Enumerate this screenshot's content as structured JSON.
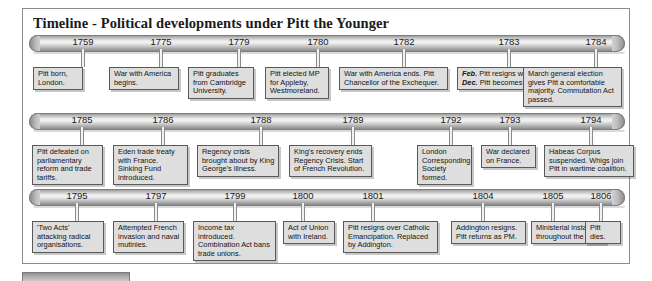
{
  "page": {
    "title": "Timeline - Political developments under Pitt the Younger"
  },
  "chart_data": {
    "type": "table",
    "title": "Timeline - Political developments under Pitt the Younger",
    "rows": [
      {
        "row_index": 1,
        "events": [
          {
            "year": "1759",
            "text": "Pitt born, London."
          },
          {
            "year": "1775",
            "text": "War with America begins."
          },
          {
            "year": "1779",
            "text": "Pitt graduates from Cambridge University."
          },
          {
            "year": "1780",
            "text": "Pitt elected MP for Appleby, Westmoreland."
          },
          {
            "year": "1782",
            "text": "War with America ends. Pitt Chancellor of the Exchequer."
          },
          {
            "year": "1783",
            "text_parts": [
              {
                "emphasis": "Feb.",
                "text": " Pitt resigns with Shelburne."
              },
              {
                "emphasis": "Dec.",
                "text": " Pitt becomes Prime Minister."
              }
            ]
          },
          {
            "year": "1784",
            "text": "March general election gives Pitt a comfortable majority. Commutation Act passed."
          }
        ]
      },
      {
        "row_index": 2,
        "events": [
          {
            "year": "1785",
            "text": "Pitt defeated on parliamentary reform and trade tariffs."
          },
          {
            "year": "1786",
            "text": "Eden trade treaty with France. Sinking Fund introduced."
          },
          {
            "year": "1788",
            "text": "Regency crisis brought about by King George's illness."
          },
          {
            "year": "1789",
            "text": "King's recovery ends Regency Crisis. Start of French Revolution."
          },
          {
            "year": "1792",
            "text": "London Corresponding Society formed."
          },
          {
            "year": "1793",
            "text": "War declared on France."
          },
          {
            "year": "1794",
            "text": "Habeas Corpus suspended. Whigs join Pitt in wartime coalition."
          }
        ]
      },
      {
        "row_index": 3,
        "events": [
          {
            "year": "1795",
            "text": "'Two Acts' attacking radical organisations."
          },
          {
            "year": "1797",
            "text": "Attempted French invasion and naval mutinies."
          },
          {
            "year": "1799",
            "text": "Income tax introduced. Combination Act bans trade unions."
          },
          {
            "year": "1800",
            "text": "Act of Union with Ireland."
          },
          {
            "year": "1801",
            "text": "Pitt resigns over Catholic Emancipation. Replaced by Addington."
          },
          {
            "year": "1804",
            "text": "Addington resigns. Pitt returns as PM."
          },
          {
            "year": "1805",
            "text": "Ministerial instability throughout the year."
          },
          {
            "year": "1806",
            "text": "Pitt dies."
          }
        ]
      }
    ]
  },
  "rows": [
    {
      "events": [
        {
          "year": "1759",
          "text": "Pitt born, London.",
          "year_x": 60,
          "stem_x": 60,
          "stem_h": 18,
          "box_x": 10,
          "box_y": 32,
          "box_w": 50,
          "box_h": 22
        },
        {
          "year": "1775",
          "text": "War with America begins.",
          "year_x": 138,
          "stem_x": 138,
          "stem_h": 18,
          "box_x": 86,
          "box_y": 32,
          "box_w": 70,
          "box_h": 22
        },
        {
          "year": "1779",
          "text": "Pitt graduates from Cambridge University.",
          "year_x": 216,
          "stem_x": 216,
          "stem_h": 18,
          "box_x": 165,
          "box_y": 32,
          "box_w": 66,
          "box_h": 31
        },
        {
          "year": "1780",
          "text": "Pitt elected MP for Appleby, Westmoreland.",
          "year_x": 295,
          "stem_x": 295,
          "stem_h": 18,
          "box_x": 242,
          "box_y": 32,
          "box_w": 64,
          "box_h": 31
        },
        {
          "year": "1782",
          "text": "War with America ends. Pitt Chancellor of the Exchequer.",
          "year_x": 381,
          "stem_x": 381,
          "stem_h": 18,
          "box_x": 316,
          "box_y": 32,
          "box_w": 109,
          "box_h": 22
        },
        {
          "year": "1783",
          "text": "",
          "year_x": 486,
          "stem_x": 486,
          "stem_h": 18,
          "box_x": 434,
          "box_y": 32,
          "box_w": 128,
          "box_h": 22,
          "rich": true
        },
        {
          "year": "1784",
          "text": "March general election gives Pitt a comfortable majority. Commutation Act passed.",
          "year_x": 573,
          "stem_x": 573,
          "stem_h": 18,
          "box_x": 500,
          "box_y": 32,
          "box_w": 99,
          "box_h": 31
        }
      ]
    },
    {
      "events": [
        {
          "year": "1785",
          "text": "Pitt defeated on parliamentary reform and trade tariffs.",
          "year_x": 59,
          "stem_x": 59,
          "stem_h": 18,
          "box_x": 9,
          "box_y": 32,
          "box_w": 71,
          "box_h": 31
        },
        {
          "year": "1786",
          "text": "Eden trade treaty with France. Sinking Fund introduced.",
          "year_x": 140,
          "stem_x": 140,
          "stem_h": 18,
          "box_x": 90,
          "box_y": 32,
          "box_w": 75,
          "box_h": 31
        },
        {
          "year": "1788",
          "text": "Regency crisis brought about by King George's illness.",
          "year_x": 238,
          "stem_x": 238,
          "stem_h": 18,
          "box_x": 174,
          "box_y": 32,
          "box_w": 82,
          "box_h": 31
        },
        {
          "year": "1789",
          "text": "King's recovery ends Regency Crisis. Start of French Revolution.",
          "year_x": 330,
          "stem_x": 330,
          "stem_h": 18,
          "box_x": 266,
          "box_y": 32,
          "box_w": 83,
          "box_h": 31
        },
        {
          "year": "1792",
          "text": "London Corresponding Society formed.",
          "year_x": 428,
          "stem_x": 428,
          "stem_h": 18,
          "box_x": 394,
          "box_y": 32,
          "box_w": 55,
          "box_h": 31
        },
        {
          "year": "1793",
          "text": "War declared on France.",
          "year_x": 487,
          "stem_x": 487,
          "stem_h": 18,
          "box_x": 458,
          "box_y": 32,
          "box_w": 55,
          "box_h": 22
        },
        {
          "year": "1794",
          "text": "Habeas Corpus suspended. Whigs join Pitt in wartime coalition.",
          "year_x": 568,
          "stem_x": 568,
          "stem_h": 18,
          "box_x": 521,
          "box_y": 32,
          "box_w": 90,
          "box_h": 31
        }
      ]
    },
    {
      "events": [
        {
          "year": "1795",
          "text": "'Two Acts' attacking radical organisations.",
          "year_x": 54,
          "stem_x": 54,
          "stem_h": 18,
          "box_x": 9,
          "box_y": 32,
          "box_w": 72,
          "box_h": 22
        },
        {
          "year": "1797",
          "text": "Attempted French invasion and naval mutinies.",
          "year_x": 133,
          "stem_x": 133,
          "stem_h": 18,
          "box_x": 90,
          "box_y": 32,
          "box_w": 71,
          "box_h": 31
        },
        {
          "year": "1799",
          "text": "Income tax introduced. Combination Act bans trade unions.",
          "year_x": 212,
          "stem_x": 212,
          "stem_h": 18,
          "box_x": 170,
          "box_y": 32,
          "box_w": 83,
          "box_h": 31
        },
        {
          "year": "1800",
          "text": "Act of Union with Ireland.",
          "year_x": 280,
          "stem_x": 280,
          "stem_h": 18,
          "box_x": 260,
          "box_y": 32,
          "box_w": 52,
          "box_h": 22
        },
        {
          "year": "1801",
          "text": "Pitt resigns over Catholic Emancipation. Replaced by Addington.",
          "year_x": 350,
          "stem_x": 350,
          "stem_h": 18,
          "box_x": 320,
          "box_y": 32,
          "box_w": 95,
          "box_h": 31
        },
        {
          "year": "1804",
          "text": "Addington resigns. Pitt returns as PM.",
          "year_x": 460,
          "stem_x": 460,
          "stem_h": 18,
          "box_x": 428,
          "box_y": 32,
          "box_w": 75,
          "box_h": 22
        },
        {
          "year": "1805",
          "text": "Ministerial instability throughout the year.",
          "year_x": 530,
          "stem_x": 530,
          "stem_h": 18,
          "box_x": 508,
          "box_y": 32,
          "box_w": 75,
          "box_h": 22
        },
        {
          "year": "1806",
          "text": "Pitt dies.",
          "year_x": 578,
          "stem_x": 578,
          "stem_h": 18,
          "box_x": 562,
          "box_y": 32,
          "box_w": 36,
          "box_h": 13
        }
      ]
    }
  ]
}
